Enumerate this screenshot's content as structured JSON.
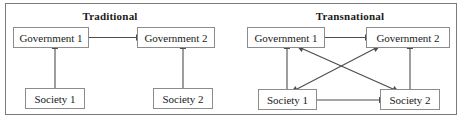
{
  "figure": {
    "background_color": "#ffffff",
    "border_color": "#7a7a7a",
    "box_border_color": "#8c8c8c",
    "text_color": "#1a1a1a",
    "arrow_color": "#4d4d4d"
  },
  "panels": [
    {
      "id": "traditional",
      "title": "Traditional",
      "nodes": [
        {
          "id": "gov1",
          "label": "Government 1"
        },
        {
          "id": "gov2",
          "label": "Government 2"
        },
        {
          "id": "soc1",
          "label": "Society 1"
        },
        {
          "id": "soc2",
          "label": "Society 2"
        }
      ],
      "connections": [
        {
          "from": "gov1",
          "to": "gov2",
          "style": "double-headed",
          "orientation": "horizontal"
        },
        {
          "from": "gov1",
          "to": "soc1",
          "style": "double-headed",
          "orientation": "vertical"
        },
        {
          "from": "gov2",
          "to": "soc2",
          "style": "double-headed",
          "orientation": "vertical"
        }
      ]
    },
    {
      "id": "transnational",
      "title": "Transnational",
      "nodes": [
        {
          "id": "gov1",
          "label": "Government 1"
        },
        {
          "id": "gov2",
          "label": "Government 2"
        },
        {
          "id": "soc1",
          "label": "Society 1"
        },
        {
          "id": "soc2",
          "label": "Society 2"
        }
      ],
      "connections": [
        {
          "from": "gov1",
          "to": "gov2",
          "style": "double-headed",
          "orientation": "horizontal"
        },
        {
          "from": "gov1",
          "to": "soc1",
          "style": "double-headed",
          "orientation": "vertical"
        },
        {
          "from": "gov2",
          "to": "soc2",
          "style": "double-headed",
          "orientation": "vertical"
        },
        {
          "from": "soc1",
          "to": "soc2",
          "style": "double-headed",
          "orientation": "horizontal"
        },
        {
          "from": "gov1",
          "to": "soc2",
          "style": "double-headed",
          "orientation": "diagonal"
        },
        {
          "from": "gov2",
          "to": "soc1",
          "style": "double-headed",
          "orientation": "diagonal"
        }
      ]
    }
  ]
}
